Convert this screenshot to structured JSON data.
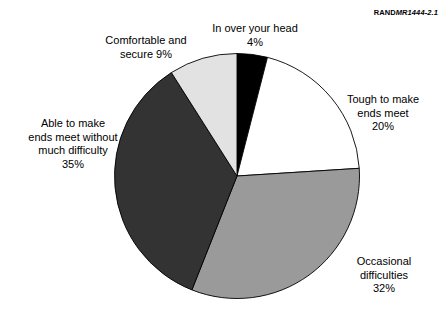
{
  "figure": {
    "source_note_brand": "RAND",
    "source_note_code": "MR1444-2.1"
  },
  "chart_data": {
    "type": "pie",
    "title": "",
    "xlabel": "",
    "ylabel": "",
    "start_angle_deg": 0,
    "direction": "clockwise",
    "legend_position": "none",
    "grid": false,
    "labels_outside": true,
    "categories": [
      "In over your head",
      "Tough to make ends meet",
      "Occasional difficulties",
      "Able to make ends meet without much difficulty",
      "Comfortable and secure"
    ],
    "values": [
      4,
      20,
      32,
      35,
      9
    ],
    "value_suffix": "%",
    "colors": [
      "#000000",
      "#ffffff",
      "#9a9a9a",
      "#333333",
      "#e2e2e2"
    ],
    "slices": [
      {
        "name": "In over your head",
        "value": 4,
        "value_label": "4%",
        "color": "#000000",
        "label_lines": "In over your head\n4%"
      },
      {
        "name": "Tough to make ends meet",
        "value": 20,
        "value_label": "20%",
        "color": "#ffffff",
        "label_lines": "Tough to make\nends meet\n20%"
      },
      {
        "name": "Occasional difficulties",
        "value": 32,
        "value_label": "32%",
        "color": "#9a9a9a",
        "label_lines": "Occasional\ndifficulties\n32%"
      },
      {
        "name": "Able to make ends meet without much difficulty",
        "value": 35,
        "value_label": "35%",
        "color": "#333333",
        "label_lines": "Able to make\nends meet without\nmuch difficulty\n35%"
      },
      {
        "name": "Comfortable and secure",
        "value": 9,
        "value_label": "9%",
        "color": "#e2e2e2",
        "label_lines": "Comfortable and\nsecure  9%"
      }
    ]
  }
}
